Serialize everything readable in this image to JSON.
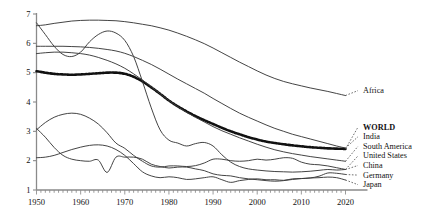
{
  "chart_data": {
    "type": "line",
    "title": "",
    "subtitle": "",
    "xlabel": "",
    "ylabel": "",
    "xlim": [
      1950,
      2020
    ],
    "ylim": [
      1,
      7
    ],
    "xticks": [
      1950,
      1960,
      1970,
      1980,
      1990,
      2000,
      2010,
      2020
    ],
    "xtick_labels": [
      "1950",
      "1960",
      "1970",
      "1980",
      "1990",
      "2000",
      "2010",
      "2020"
    ],
    "yticks": [
      1,
      2,
      3,
      4,
      5,
      6,
      7
    ],
    "ytick_labels": [
      "1",
      "2",
      "3",
      "4",
      "5",
      "6",
      "7"
    ],
    "minor_xtick_interval": 1,
    "grid": false,
    "legend_position": "right",
    "x": [
      1950,
      1952,
      1954,
      1956,
      1958,
      1960,
      1962,
      1964,
      1966,
      1968,
      1970,
      1972,
      1974,
      1976,
      1978,
      1980,
      1982,
      1984,
      1986,
      1988,
      1990,
      1992,
      1994,
      1996,
      1998,
      2000,
      2002,
      2004,
      2006,
      2008,
      2010,
      2012,
      2014,
      2016,
      2018,
      2020
    ],
    "series": [
      {
        "name": "Africa",
        "style": "solid",
        "color": "#3a3a3a",
        "label_value": "Africa",
        "values": [
          6.6,
          6.63,
          6.68,
          6.72,
          6.76,
          6.78,
          6.79,
          6.79,
          6.78,
          6.77,
          6.74,
          6.7,
          6.65,
          6.6,
          6.53,
          6.45,
          6.35,
          6.24,
          6.12,
          5.99,
          5.84,
          5.68,
          5.52,
          5.36,
          5.21,
          5.06,
          4.92,
          4.8,
          4.7,
          4.62,
          4.55,
          4.48,
          4.42,
          4.36,
          4.29,
          4.22
        ]
      },
      {
        "name": "WORLD",
        "style": "dotted-thick",
        "color": "#111111",
        "label_value": "WORLD",
        "values": [
          5.05,
          5.0,
          4.96,
          4.94,
          4.93,
          4.94,
          4.96,
          4.98,
          5.0,
          5.0,
          4.96,
          4.86,
          4.7,
          4.5,
          4.28,
          4.05,
          3.85,
          3.68,
          3.52,
          3.38,
          3.25,
          3.12,
          3.0,
          2.9,
          2.8,
          2.72,
          2.65,
          2.6,
          2.56,
          2.52,
          2.49,
          2.46,
          2.44,
          2.42,
          2.41,
          2.4
        ]
      },
      {
        "name": "India",
        "style": "solid",
        "color": "#3a3a3a",
        "label_value": "India",
        "values": [
          5.9,
          5.9,
          5.9,
          5.9,
          5.89,
          5.88,
          5.86,
          5.83,
          5.79,
          5.74,
          5.66,
          5.55,
          5.42,
          5.28,
          5.12,
          4.95,
          4.78,
          4.62,
          4.46,
          4.3,
          4.12,
          3.95,
          3.78,
          3.62,
          3.48,
          3.35,
          3.22,
          3.1,
          3.0,
          2.9,
          2.82,
          2.74,
          2.66,
          2.58,
          2.5,
          2.43
        ]
      },
      {
        "name": "South America",
        "style": "solid",
        "color": "#3a3a3a",
        "label_value": "South America",
        "values": [
          5.65,
          5.68,
          5.7,
          5.7,
          5.68,
          5.65,
          5.6,
          5.52,
          5.42,
          5.3,
          5.15,
          4.96,
          4.75,
          4.52,
          4.28,
          4.05,
          3.84,
          3.65,
          3.48,
          3.32,
          3.16,
          3.02,
          2.9,
          2.78,
          2.67,
          2.56,
          2.46,
          2.37,
          2.3,
          2.24,
          2.19,
          2.14,
          2.1,
          2.06,
          2.02,
          1.98
        ]
      },
      {
        "name": "China",
        "style": "solid",
        "color": "#3a3a3a",
        "label_value": "China",
        "values": [
          6.7,
          6.3,
          5.9,
          5.62,
          5.55,
          5.7,
          6.05,
          6.3,
          6.42,
          6.35,
          6.1,
          5.55,
          4.7,
          3.8,
          3.05,
          2.7,
          2.6,
          2.5,
          2.58,
          2.62,
          2.5,
          2.2,
          1.95,
          1.8,
          1.72,
          1.68,
          1.65,
          1.63,
          1.62,
          1.61,
          1.62,
          1.64,
          1.67,
          1.7,
          1.68,
          1.7
        ]
      },
      {
        "name": "United States",
        "style": "solid",
        "color": "#3a3a3a",
        "label_value": "United States",
        "values": [
          3.05,
          3.3,
          3.48,
          3.58,
          3.62,
          3.58,
          3.45,
          3.25,
          2.95,
          2.6,
          2.42,
          2.18,
          1.98,
          1.82,
          1.78,
          1.82,
          1.82,
          1.8,
          1.83,
          1.92,
          2.05,
          2.05,
          2.0,
          1.98,
          2.0,
          2.05,
          2.02,
          2.05,
          2.1,
          2.08,
          1.95,
          1.88,
          1.86,
          1.82,
          1.76,
          1.7
        ]
      },
      {
        "name": "Germany",
        "style": "solid",
        "color": "#3a3a3a",
        "label_value": "Germany",
        "values": [
          2.1,
          2.12,
          2.18,
          2.28,
          2.38,
          2.46,
          2.52,
          2.54,
          2.5,
          2.38,
          2.18,
          1.9,
          1.62,
          1.48,
          1.42,
          1.45,
          1.42,
          1.36,
          1.38,
          1.42,
          1.45,
          1.35,
          1.26,
          1.32,
          1.36,
          1.38,
          1.35,
          1.35,
          1.33,
          1.38,
          1.39,
          1.41,
          1.47,
          1.58,
          1.57,
          1.53
        ]
      },
      {
        "name": "Japan",
        "style": "solid",
        "color": "#3a3a3a",
        "label_value": "Japan",
        "values": [
          3.1,
          2.8,
          2.45,
          2.18,
          2.05,
          2.0,
          1.98,
          2.02,
          1.6,
          2.12,
          2.12,
          2.12,
          2.05,
          1.88,
          1.8,
          1.75,
          1.78,
          1.78,
          1.72,
          1.66,
          1.55,
          1.5,
          1.48,
          1.42,
          1.38,
          1.35,
          1.32,
          1.3,
          1.32,
          1.36,
          1.39,
          1.41,
          1.42,
          1.44,
          1.42,
          1.34
        ]
      }
    ]
  },
  "axes": {
    "y_labels": [
      "7",
      "6",
      "5",
      "4",
      "3",
      "2",
      "1"
    ],
    "x_labels": [
      "1950",
      "1960",
      "1970",
      "1980",
      "1990",
      "2000",
      "2010",
      "2020"
    ]
  },
  "legend": {
    "top_entry": "Africa",
    "entries": [
      "WORLD",
      "India",
      "South America",
      "United States",
      "China",
      "Germany",
      "Japan"
    ]
  }
}
